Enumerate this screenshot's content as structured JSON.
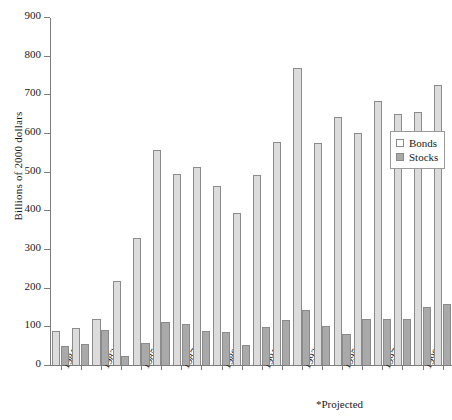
{
  "chart_data": {
    "type": "bar",
    "title": "",
    "subtitle": "",
    "xlabel": "",
    "ylabel": "Billions of 2000 dollars",
    "ylim": [
      0,
      900
    ],
    "ytick_values": [
      0,
      100,
      200,
      300,
      400,
      500,
      600,
      700,
      800,
      900
    ],
    "ytick_labels": [
      "0",
      "100",
      "200",
      "300",
      "400",
      "500",
      "600",
      "700",
      "800",
      "900"
    ],
    "grid": false,
    "legend_position": "right",
    "categories": [
      "1981",
      "1982",
      "1983",
      "1984",
      "1985",
      "1986",
      "1987",
      "1988",
      "1989",
      "1990",
      "1991",
      "1992",
      "1993",
      "1994",
      "1995",
      "1996",
      "1997",
      "1998",
      "1999",
      "2000"
    ],
    "xtick_labels": [
      "1981",
      "",
      "1983",
      "",
      "1985",
      "",
      "1987",
      "",
      "1989",
      "",
      "1991",
      "",
      "1993",
      "",
      "1995",
      "",
      "1997",
      "",
      "1999",
      ""
    ],
    "series": [
      {
        "name": "Bonds",
        "color": "#dcdcdc",
        "values": [
          88,
          97,
          118,
          216,
          328,
          556,
          493,
          511,
          463,
          392,
          492,
          577,
          768,
          574,
          641,
          599,
          684,
          649,
          654,
          724
        ]
      },
      {
        "name": "Stocks",
        "color": "#a9a9a9",
        "values": [
          50,
          55,
          90,
          24,
          58,
          110,
          106,
          88,
          86,
          52,
          98,
          116,
          143,
          100,
          80,
          118,
          120,
          118,
          151,
          159
        ]
      }
    ],
    "annotations": [
      {
        "text": "*Projected",
        "position": "bottom-right"
      }
    ]
  },
  "legend": {
    "items": [
      {
        "label": "Bonds"
      },
      {
        "label": "Stocks"
      }
    ]
  },
  "footnote": {
    "text": "*Projected"
  }
}
